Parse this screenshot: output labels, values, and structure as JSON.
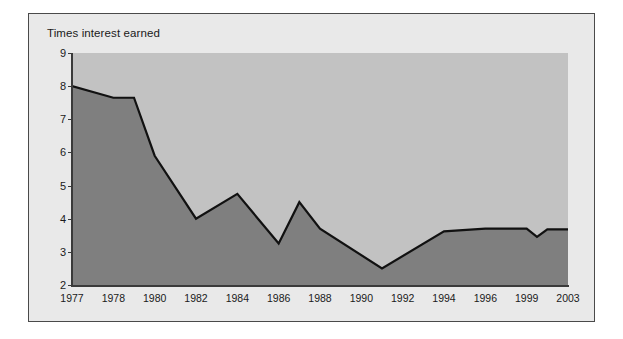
{
  "chart_data": {
    "type": "area",
    "title": "Times interest earned",
    "xlabel": "",
    "ylabel": "",
    "ylim": [
      2,
      9
    ],
    "xlim": [
      1977,
      2003
    ],
    "grid": false,
    "legend": null,
    "yticks": [
      2,
      3,
      4,
      5,
      6,
      7,
      8,
      9
    ],
    "ytick_labels": [
      "2",
      "3",
      "4",
      "5",
      "6",
      "7",
      "8",
      "9"
    ],
    "xticks": [
      1977,
      1978,
      1980,
      1982,
      1984,
      1986,
      1988,
      1990,
      1992,
      1994,
      1996,
      1999,
      2003
    ],
    "xtick_labels": [
      "1977",
      "1978",
      "1980",
      "1982",
      "1984",
      "1986",
      "1988",
      "1990",
      "1992",
      "1994",
      "1996",
      "1999",
      "2003"
    ],
    "x": [
      1977,
      1978,
      1979,
      1980,
      1982,
      1984,
      1986,
      1987,
      1988,
      1991,
      1994,
      1996,
      1999,
      2000,
      2001,
      2003
    ],
    "values": [
      8.0,
      7.65,
      7.65,
      5.9,
      4.0,
      4.75,
      3.25,
      4.5,
      3.7,
      2.5,
      3.62,
      3.7,
      3.7,
      3.45,
      3.68,
      3.68
    ],
    "series": [
      {
        "name": "Times interest earned",
        "values": [
          8.0,
          7.65,
          7.65,
          5.9,
          4.0,
          4.75,
          3.25,
          4.5,
          3.7,
          2.5,
          3.62,
          3.7,
          3.7,
          3.45,
          3.68,
          3.68
        ]
      }
    ],
    "colors": {
      "area_fill": "#7f7f7f",
      "plot_background": "#c2c2c2",
      "line": "#111111",
      "panel_background": "#e9e9e9",
      "panel_border": "#4a4a4a",
      "axis": "#3a3a3a",
      "text": "#1a1a1a",
      "page_background": "#ffffff"
    }
  }
}
